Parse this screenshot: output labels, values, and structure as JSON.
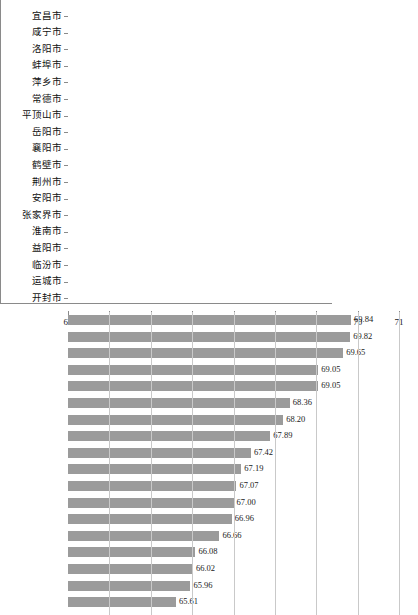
{
  "chart_data": {
    "type": "bar",
    "orientation": "horizontal",
    "title": "",
    "subtitle": "",
    "xlabel": "",
    "ylabel": "",
    "xlim": [
      63,
      71
    ],
    "xticks": [
      63,
      64,
      65,
      66,
      67,
      68,
      69,
      70,
      71
    ],
    "xtick_labels": [
      "63",
      "64",
      "65",
      "66",
      "67",
      "68",
      "69",
      "70",
      "71"
    ],
    "grid": true,
    "grid_axis": "x",
    "legend": false,
    "legend_position": "none",
    "bar_color": "#9b9b9b",
    "gridline_color": "#c9c9c9",
    "axis_color": "#8a8a8a",
    "categories": [
      "宜昌市",
      "咸宁市",
      "洛阳市",
      "蚌埠市",
      "萍乡市",
      "常德市",
      "平顶山市",
      "岳阳市",
      "襄阳市",
      "鹤壁市",
      "荆州市",
      "安阳市",
      "张家界市",
      "淮南市",
      "益阳市",
      "临汾市",
      "运城市",
      "开封市"
    ],
    "values": [
      69.84,
      69.82,
      69.65,
      69.05,
      69.05,
      68.36,
      68.2,
      67.89,
      67.42,
      67.19,
      67.07,
      67.0,
      66.96,
      66.66,
      66.08,
      66.02,
      65.96,
      65.61
    ],
    "value_labels": [
      "69.84",
      "69.82",
      "69.65",
      "69.05",
      "69.05",
      "68.36",
      "68.20",
      "67.89",
      "67.42",
      "67.19",
      "67.07",
      "67.00",
      "66.96",
      "66.66",
      "66.08",
      "66.02",
      "65.96",
      "65.61"
    ]
  }
}
